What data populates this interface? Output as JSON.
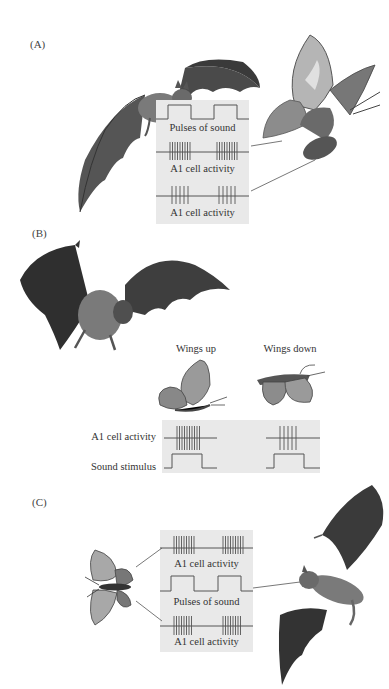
{
  "figure": {
    "panels": [
      {
        "id": "A",
        "label": "(A)",
        "traces": {
          "pulses_label": "Pulses of sound",
          "activity_top_label": "A1 cell activity",
          "activity_bottom_label": "A1 cell activity"
        }
      },
      {
        "id": "B",
        "label": "(B)",
        "moth_states": {
          "wings_up_label": "Wings up",
          "wings_down_label": "Wings down"
        },
        "rows": {
          "activity_label": "A1 cell activity",
          "stimulus_label": "Sound stimulus"
        }
      },
      {
        "id": "C",
        "label": "(C)",
        "traces": {
          "activity_top_label": "A1 cell activity",
          "pulses_label": "Pulses of sound",
          "activity_bottom_label": "A1 cell activity"
        }
      }
    ],
    "colors": {
      "trace_box": "#e9e9e9",
      "trace_line": "#555555",
      "bat_dark": "#3a3a3a",
      "bat_mid": "#6b6b6b",
      "moth_light": "#b8b8b8",
      "moth_dark": "#5a5a5a"
    },
    "icons": {
      "bat": "bat-illustration",
      "moth": "moth-illustration"
    }
  }
}
